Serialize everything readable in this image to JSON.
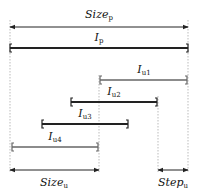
{
  "diagram": {
    "colors": {
      "dark": "#222222",
      "gray": "#666666",
      "guide": "#bbbbbb"
    },
    "dimensions": {
      "size_p": {
        "base": "Size",
        "sub": "p",
        "x1": 10,
        "x2": 188,
        "y": 27,
        "label_x": 99,
        "label_y": 9
      },
      "size_u": {
        "base": "Size",
        "sub": "u",
        "x1": 10,
        "x2": 99,
        "y": 170,
        "label_x": 54,
        "label_y": 177
      },
      "step_u": {
        "base": "Step",
        "sub": "u",
        "x1": 158,
        "x2": 188,
        "y": 170,
        "label_x": 173,
        "label_y": 177
      }
    },
    "intervals": [
      {
        "id": "I_p",
        "base": "I",
        "sub": "p",
        "x1": 10,
        "x2": 188,
        "y": 48,
        "color": "dark",
        "width": 2.2,
        "label_x": 99,
        "label_y": 32
      },
      {
        "id": "I_u1",
        "base": "I",
        "sub": "u1",
        "x1": 100,
        "x2": 187,
        "y": 80,
        "color": "gray",
        "width": 1.4,
        "label_x": 144,
        "label_y": 64
      },
      {
        "id": "I_u2",
        "base": "I",
        "sub": "u2",
        "x1": 71,
        "x2": 157,
        "y": 102,
        "color": "dark",
        "width": 1.8,
        "label_x": 114,
        "label_y": 86
      },
      {
        "id": "I_u3",
        "base": "I",
        "sub": "u3",
        "x1": 42,
        "x2": 128,
        "y": 124,
        "color": "dark",
        "width": 1.8,
        "label_x": 85,
        "label_y": 108
      },
      {
        "id": "I_u4",
        "base": "I",
        "sub": "u4",
        "x1": 12,
        "x2": 98,
        "y": 147,
        "color": "gray",
        "width": 1.4,
        "label_x": 55,
        "label_y": 131
      }
    ],
    "guides": [
      {
        "x": 10,
        "y1": 20,
        "y2": 172
      },
      {
        "x": 99,
        "y1": 75,
        "y2": 172
      },
      {
        "x": 158,
        "y1": 96,
        "y2": 172
      },
      {
        "x": 188,
        "y1": 20,
        "y2": 172
      }
    ]
  }
}
